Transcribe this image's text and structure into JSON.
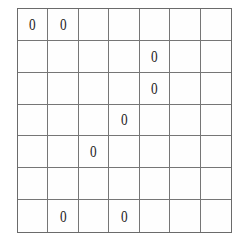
{
  "figure": {
    "name": "seven-by-seven-grid",
    "rows": 7,
    "columns": 7,
    "mark_symbol": "0",
    "line_color": "#6b6b6b",
    "mark_color": "#1d1d1d",
    "background_color": "#ffffff"
  },
  "chart_data": {
    "type": "heatmap",
    "title": "",
    "xlabel": "",
    "ylabel": "",
    "rows": 7,
    "columns": 7,
    "grid": true,
    "legend": "",
    "cell_symbol": "0",
    "marked_cells": [
      {
        "row": 1,
        "col": 1
      },
      {
        "row": 1,
        "col": 2
      },
      {
        "row": 2,
        "col": 5
      },
      {
        "row": 3,
        "col": 5
      },
      {
        "row": 4,
        "col": 4
      },
      {
        "row": 5,
        "col": 3
      },
      {
        "row": 7,
        "col": 2
      },
      {
        "row": 7,
        "col": 4
      }
    ],
    "matrix": [
      [
        "0",
        "0",
        "",
        "",
        "",
        "",
        ""
      ],
      [
        "",
        "",
        "",
        "",
        "0",
        "",
        ""
      ],
      [
        "",
        "",
        "",
        "",
        "0",
        "",
        ""
      ],
      [
        "",
        "",
        "",
        "0",
        "",
        "",
        ""
      ],
      [
        "",
        "",
        "0",
        "",
        "",
        "",
        ""
      ],
      [
        "",
        "",
        "",
        "",
        "",
        "",
        ""
      ],
      [
        "",
        "0",
        "",
        "0",
        "",
        "",
        ""
      ]
    ]
  },
  "cells": {
    "r1c1": "0",
    "r1c2": "0",
    "r1c3": "",
    "r1c4": "",
    "r1c5": "",
    "r1c6": "",
    "r1c7": "",
    "r2c1": "",
    "r2c2": "",
    "r2c3": "",
    "r2c4": "",
    "r2c5": "0",
    "r2c6": "",
    "r2c7": "",
    "r3c1": "",
    "r3c2": "",
    "r3c3": "",
    "r3c4": "",
    "r3c5": "0",
    "r3c6": "",
    "r3c7": "",
    "r4c1": "",
    "r4c2": "",
    "r4c3": "",
    "r4c4": "0",
    "r4c5": "",
    "r4c6": "",
    "r4c7": "",
    "r5c1": "",
    "r5c2": "",
    "r5c3": "0",
    "r5c4": "",
    "r5c5": "",
    "r5c6": "",
    "r5c7": "",
    "r6c1": "",
    "r6c2": "",
    "r6c3": "",
    "r6c4": "",
    "r6c5": "",
    "r6c6": "",
    "r6c7": "",
    "r7c1": "",
    "r7c2": "0",
    "r7c3": "",
    "r7c4": "0",
    "r7c5": "",
    "r7c6": "",
    "r7c7": ""
  }
}
